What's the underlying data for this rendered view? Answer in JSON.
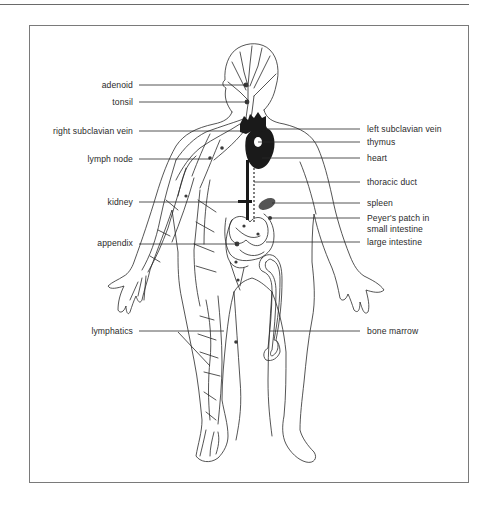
{
  "figure": {
    "colors": {
      "line": "#2a2a2a",
      "organ_fill": "#1a1a1a",
      "spleen_fill": "#555555",
      "frame": "#7a7a7a"
    }
  },
  "labels": {
    "left": [
      {
        "id": "adenoid",
        "text": "adenoid"
      },
      {
        "id": "tonsil",
        "text": "tonsil"
      },
      {
        "id": "right_subclavian_vein",
        "text": "right subclavian vein"
      },
      {
        "id": "lymph_node",
        "text": "lymph node"
      },
      {
        "id": "kidney",
        "text": "kidney"
      },
      {
        "id": "appendix",
        "text": "appendix"
      },
      {
        "id": "lymphatics",
        "text": "lymphatics"
      }
    ],
    "right": [
      {
        "id": "left_subclavian_vein",
        "text": "left subclavian vein"
      },
      {
        "id": "thymus",
        "text": "thymus"
      },
      {
        "id": "heart",
        "text": "heart"
      },
      {
        "id": "thoracic_duct",
        "text": "thoracic duct"
      },
      {
        "id": "spleen",
        "text": "spleen"
      },
      {
        "id": "peyers_patch_1",
        "text": "Peyer's patch in"
      },
      {
        "id": "peyers_patch_2",
        "text": "small intestine"
      },
      {
        "id": "large_intestine",
        "text": "large intestine"
      },
      {
        "id": "bone_marrow",
        "text": "bone marrow"
      }
    ]
  }
}
